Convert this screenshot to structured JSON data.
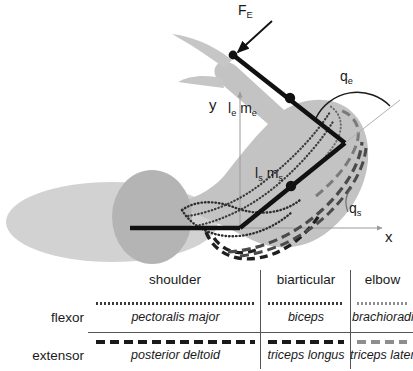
{
  "figure": {
    "labels": {
      "force_external": "F",
      "force_external_sub": "E",
      "axis_y": "y",
      "axis_x": "x",
      "elbow_segment": "l",
      "elbow_segment_sub": "e",
      "elbow_mass": "m",
      "elbow_mass_sub": "e",
      "shoulder_segment": "l",
      "shoulder_segment_sub": "s",
      "shoulder_mass": "m",
      "shoulder_mass_sub": "s",
      "angle_elbow": "q",
      "angle_elbow_sub": "e",
      "angle_shoulder": "q",
      "angle_shoulder_sub": "s"
    },
    "colors": {
      "body_fill": "#d2d2d2",
      "shoulder_fill": "#b4b4b4",
      "arm_fill": "#c3c3c3",
      "segment_stroke": "#111111",
      "axis_stroke": "#9a9a9a",
      "muscle_dark": "#2e2e2e",
      "muscle_mid": "#5c5c5c",
      "muscle_light": "#8e8e8e"
    },
    "geometry": {
      "shoulder_joint": [
        240,
        228
      ],
      "elbow_joint": [
        345,
        143
      ],
      "hand_endpoint": [
        233,
        55
      ],
      "upper_arm_com": [
        291,
        186
      ],
      "forearm_com": [
        290,
        98
      ],
      "origin": [
        240,
        228
      ]
    }
  },
  "legend": {
    "columns": [
      "shoulder",
      "biarticular",
      "elbow"
    ],
    "rows": [
      {
        "label": "flexor",
        "style": "dotted",
        "muscles": [
          "pectoralis major",
          "biceps",
          "brachioradialis"
        ]
      },
      {
        "label": "extensor",
        "style": "dashed",
        "muscles": [
          "posterior deltoid",
          "triceps longus",
          "triceps lateralus"
        ]
      }
    ]
  }
}
